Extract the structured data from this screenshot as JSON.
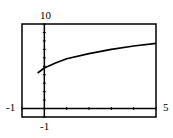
{
  "chart_data": {
    "type": "line",
    "title": "",
    "xlabel": "",
    "ylabel": "",
    "xlim": [
      -1,
      5
    ],
    "ylim": [
      -1,
      10
    ],
    "grid": false,
    "tick_labels": {
      "xmin": "-1",
      "xmax": "5",
      "ymin": "-1",
      "ymax": "10"
    },
    "x_tick_step": 1,
    "y_tick_step": 1,
    "series": [
      {
        "name": "curve",
        "x": [
          -0.3,
          0,
          0.5,
          1,
          2,
          3,
          4,
          5
        ],
        "y": [
          4.2,
          4.8,
          5.4,
          5.9,
          6.5,
          7.0,
          7.4,
          7.7
        ]
      }
    ]
  },
  "colors": {
    "line": "#000000",
    "background": "#ffffff"
  }
}
